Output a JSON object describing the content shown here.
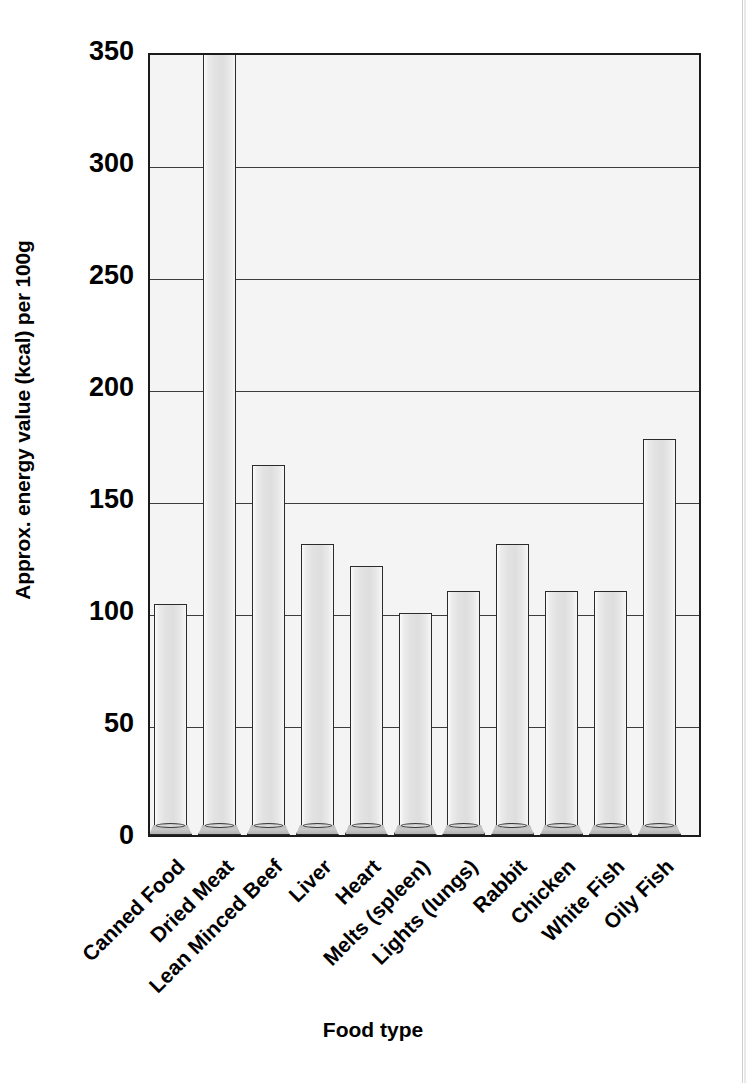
{
  "chart_data": {
    "type": "bar",
    "title": "",
    "xlabel": "Food type",
    "ylabel": "Approx. energy value (kcal) per 100g",
    "categories": [
      "Canned Food",
      "Dried Meat",
      "Lean Minced Beef",
      "Liver",
      "Heart",
      "Melts (spleen)",
      "Lights (lungs)",
      "Rabbit",
      "Chicken",
      "White Fish",
      "Oily Fish"
    ],
    "values": [
      103,
      350,
      165,
      130,
      120,
      99,
      109,
      130,
      109,
      109,
      177
    ],
    "value_notes": {
      "Dried Meat": "exceeds axis maximum; bar clipped at 350"
    },
    "ylim": [
      0,
      350
    ],
    "ytick_labels": [
      "0",
      "50",
      "100",
      "150",
      "200",
      "250",
      "300",
      "350"
    ],
    "ytick_values": [
      0,
      50,
      100,
      150,
      200,
      250,
      300,
      350
    ],
    "grid": "horizontal",
    "legend": "none",
    "bar_fill_color": "#e4e4e4",
    "bar_edge_color": "#2b2b2b",
    "plot_background_color": "#f4f4f4",
    "axis_color": "#1b1b1b"
  }
}
